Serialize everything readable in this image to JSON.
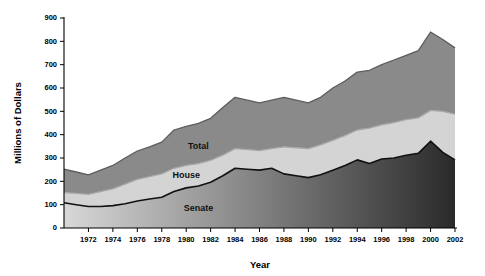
{
  "chart_data": {
    "type": "area",
    "title": "",
    "xlabel": "Year",
    "ylabel": "Millions of Dollars",
    "xlim": [
      1970,
      2002
    ],
    "ylim": [
      0,
      900
    ],
    "ytick_step": 100,
    "xtick_step": 2,
    "grid": false,
    "legend": "inline-labels",
    "stacked": false,
    "note": "Three cumulative boundary curves; bands between them are filled. Senate band shaded with a left-to-right light-to-dark gradient.",
    "x": [
      1970,
      1971,
      1972,
      1973,
      1974,
      1975,
      1976,
      1977,
      1978,
      1979,
      1980,
      1981,
      1982,
      1983,
      1984,
      1985,
      1986,
      1987,
      1988,
      1989,
      1990,
      1991,
      1992,
      1993,
      1994,
      1995,
      1996,
      1997,
      1998,
      1999,
      2000,
      2001,
      2002
    ],
    "xticks": [
      1972,
      1974,
      1976,
      1978,
      1980,
      1982,
      1984,
      1986,
      1988,
      1990,
      1992,
      1994,
      1996,
      1998,
      2000,
      2002
    ],
    "yticks": [
      0,
      100,
      200,
      300,
      400,
      500,
      600,
      700,
      800,
      900
    ],
    "series": [
      {
        "name": "Total",
        "color": "#8a8a8a",
        "line_color": "#5c5c5c",
        "label_x": 1981,
        "label_y": 340,
        "values": [
          252,
          240,
          228,
          248,
          268,
          300,
          330,
          348,
          368,
          420,
          436,
          448,
          470,
          516,
          560,
          548,
          536,
          548,
          560,
          548,
          536,
          560,
          600,
          630,
          668,
          676,
          700,
          720,
          740,
          760,
          840,
          808,
          772
        ]
      },
      {
        "name": "House",
        "color": "#d4d4d4",
        "line_color": "#a8a8a8",
        "label_x": 1980,
        "label_y": 215,
        "values": [
          152,
          148,
          144,
          156,
          168,
          188,
          208,
          220,
          232,
          256,
          268,
          276,
          290,
          312,
          340,
          336,
          332,
          340,
          348,
          344,
          340,
          356,
          376,
          396,
          420,
          428,
          442,
          452,
          464,
          472,
          504,
          500,
          488
        ]
      },
      {
        "name": "Senate",
        "color_from": "#d8d8d8",
        "color_to": "#2a2a2a",
        "line_color": "#111111",
        "label_x": 1981,
        "label_y": 72,
        "values": [
          108,
          100,
          92,
          92,
          96,
          104,
          116,
          124,
          132,
          156,
          172,
          180,
          196,
          224,
          256,
          252,
          248,
          256,
          232,
          224,
          216,
          228,
          248,
          268,
          292,
          276,
          296,
          300,
          312,
          320,
          372,
          324,
          292
        ]
      }
    ]
  },
  "axes": {
    "y_title": "Millions of Dollars",
    "x_title": "Year"
  }
}
